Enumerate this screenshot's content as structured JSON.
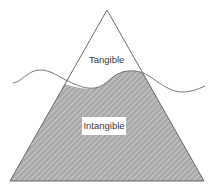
{
  "diagram": {
    "type": "iceberg",
    "regions": [
      {
        "id": "above-water",
        "label": "Tangible",
        "fill": "#ffffff"
      },
      {
        "id": "below-water",
        "label": "Intangible",
        "fill": "#a8a8a8",
        "pattern": "diagonal-hatch"
      }
    ],
    "colors": {
      "outline": "#5a5a5a",
      "hatch_dark": "#8c8c8c",
      "hatch_light": "#d4d4d4",
      "water_line": "#6a6a6a",
      "text": "#3a3a3a"
    }
  }
}
